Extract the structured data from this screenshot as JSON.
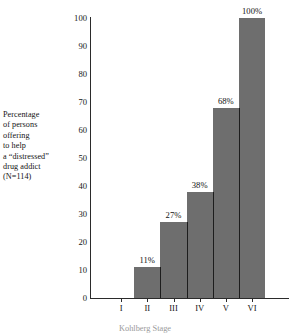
{
  "chart_data": {
    "type": "bar",
    "title": "",
    "categories": [
      "I",
      "II",
      "III",
      "IV",
      "V",
      "VI"
    ],
    "values": [
      0,
      11,
      27,
      38,
      68,
      100
    ],
    "value_labels": [
      "",
      "11%",
      "27%",
      "38%",
      "68%",
      "100%"
    ],
    "xlabel": "Kohlberg Stage",
    "ylabel": "Percentage of persons offering to help a \"distressed\" drug addict (N=114)",
    "ylim": [
      0,
      100
    ],
    "ytick_labels": [
      "0",
      "10",
      "20",
      "30",
      "40",
      "50",
      "60",
      "70",
      "80",
      "90",
      "100"
    ],
    "ytick_values": [
      0,
      10,
      20,
      30,
      40,
      50,
      60,
      70,
      80,
      90,
      100
    ],
    "grid": false,
    "legend": "none",
    "bar_color": "#6e6e6e",
    "axis_color": "#2b2b2b",
    "text_color": "#131313",
    "background": "#ffffff",
    "sample_size": "N=114"
  },
  "caption": {
    "lines": [
      "Percentage",
      "of persons",
      "offering",
      "to help",
      "a “distressed”",
      "drug addict",
      "(N=114)"
    ]
  },
  "axis_title_bottom": "Kohlberg Stage"
}
